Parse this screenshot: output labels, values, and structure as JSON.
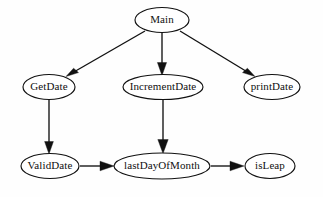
{
  "diagram": {
    "type": "directed-graph",
    "background_color": "#fefefe",
    "node_fill_color": "#ffffff",
    "node_stroke_color": "#111111",
    "edge_color": "#111111",
    "nodes": [
      {
        "id": "main",
        "label": "Main",
        "cx": 162,
        "cy": 20,
        "rx": 27,
        "ry": 12.5,
        "row": "top"
      },
      {
        "id": "getdate",
        "label": "GetDate",
        "cx": 49,
        "cy": 87,
        "rx": 26,
        "ry": 12.5,
        "row": "middle"
      },
      {
        "id": "incrementdate",
        "label": "IncrementDate",
        "cx": 163,
        "cy": 87,
        "rx": 40,
        "ry": 12.5,
        "row": "middle"
      },
      {
        "id": "printdate",
        "label": "printDate",
        "cx": 272,
        "cy": 87,
        "rx": 28,
        "ry": 12.5,
        "row": "middle"
      },
      {
        "id": "validdate",
        "label": "ValidDate",
        "cx": 50,
        "cy": 166,
        "rx": 29,
        "ry": 12.5,
        "row": "bottom"
      },
      {
        "id": "lastdayofmonth",
        "label": "lastDayOfMonth",
        "cx": 162,
        "cy": 166,
        "rx": 48,
        "ry": 13,
        "row": "bottom"
      },
      {
        "id": "isleap",
        "label": "isLeap",
        "cx": 270,
        "cy": 166,
        "rx": 25,
        "ry": 12.5,
        "row": "bottom"
      }
    ],
    "edges": [
      {
        "id": "main-to-getdate",
        "from": "Main",
        "to": "GetDate",
        "x1": 145,
        "y1": 31,
        "x2": 66,
        "y2": 76,
        "direction": "down-left"
      },
      {
        "id": "main-to-incrementdate",
        "from": "Main",
        "to": "IncrementDate",
        "x1": 162,
        "y1": 33,
        "x2": 162,
        "y2": 74,
        "direction": "down"
      },
      {
        "id": "main-to-printdate",
        "from": "Main",
        "to": "printDate",
        "x1": 180,
        "y1": 31,
        "x2": 255,
        "y2": 76,
        "direction": "down-right"
      },
      {
        "id": "getdate-to-validdate",
        "from": "GetDate",
        "to": "ValidDate",
        "x1": 49,
        "y1": 100,
        "x2": 49,
        "y2": 153,
        "direction": "down"
      },
      {
        "id": "incrementdate-to-lastdayofmonth",
        "from": "IncrementDate",
        "to": "lastDayOfMonth",
        "x1": 163,
        "y1": 100,
        "x2": 163,
        "y2": 153,
        "direction": "down"
      },
      {
        "id": "validdate-to-lastdayofmonth",
        "from": "ValidDate",
        "to": "lastDayOfMonth",
        "x1": 80,
        "y1": 166,
        "x2": 113,
        "y2": 166,
        "direction": "right"
      },
      {
        "id": "lastdayofmonth-to-isleap",
        "from": "lastDayOfMonth",
        "to": "isLeap",
        "x1": 211,
        "y1": 166,
        "x2": 243,
        "y2": 166,
        "direction": "right"
      }
    ]
  }
}
